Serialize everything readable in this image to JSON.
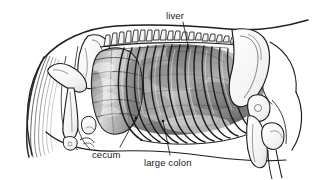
{
  "figure": {
    "type": "anatomical-illustration",
    "style": "grayscale pen-and-ink with halftone shading",
    "background_color": "#ffffff",
    "ink_color": "#1a1a1a"
  },
  "labels": [
    {
      "id": "liver",
      "text": "liver",
      "text_x": 166,
      "text_y": 11,
      "leader": {
        "x1": 183,
        "y1": 22,
        "x2": 189,
        "y2": 50
      }
    },
    {
      "id": "cecum",
      "text": "cecum",
      "text_x": 92,
      "text_y": 150,
      "leader": {
        "x1": 120,
        "y1": 147,
        "x2": 136,
        "y2": 118
      }
    },
    {
      "id": "large-colon",
      "text": "large colon",
      "text_x": 144,
      "text_y": 158,
      "leader": {
        "x1": 170,
        "y1": 155,
        "x2": 163,
        "y2": 121
      }
    }
  ],
  "structures": [
    {
      "id": "body-outline",
      "name": "horse body outline"
    },
    {
      "id": "mane",
      "name": "mane hatching"
    },
    {
      "id": "vertebral-column",
      "name": "thoracic vertebrae spinous processes"
    },
    {
      "id": "ribcage",
      "name": "ribcage",
      "rib_count": 18
    },
    {
      "id": "scapula",
      "name": "scapula and shoulder bones"
    },
    {
      "id": "foreleg-bones",
      "name": "humerus and foreleg bones"
    },
    {
      "id": "pelvis-femur",
      "name": "pelvis and femur"
    },
    {
      "id": "cecum-organ",
      "name": "cecum, segmented sacculated organ"
    },
    {
      "id": "large-colon-organ",
      "name": "large colon, shaded mass behind ribs"
    },
    {
      "id": "liver-organ",
      "name": "liver, under dorsal ribs"
    }
  ]
}
